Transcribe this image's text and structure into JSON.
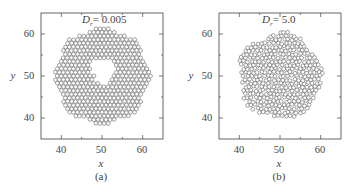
{
  "chart_data": [
    {
      "type": "scatter",
      "panel_label": "(a)",
      "annotation": {
        "symbol": "D",
        "subscript": "r",
        "value": "= 0.005"
      },
      "xlabel": "x",
      "ylabel": "y",
      "xlim": [
        35,
        65
      ],
      "ylim": [
        35,
        65
      ],
      "xticks": [
        40,
        50,
        60
      ],
      "yticks": [
        40,
        50,
        60
      ],
      "minor_xticks": [
        45,
        55
      ],
      "minor_yticks": [
        45,
        55
      ],
      "grid": false,
      "marker": "open circle",
      "description": "Ring-shaped cluster of ~400 close-packed disks centred near (50,50), outer radius ~11.5, with an empty central cavity of radius ~3 at about (50,51)",
      "cluster": {
        "center": [
          50,
          50
        ],
        "outer_radius": 11.5,
        "cavity_center": [
          50.3,
          51.2
        ],
        "cavity_radius": 3.0,
        "particle_diameter": 1.0
      }
    },
    {
      "type": "scatter",
      "panel_label": "(b)",
      "annotation": {
        "symbol": "D",
        "subscript": "r",
        "value": "= 5.0"
      },
      "xlabel": "x",
      "ylabel": "y",
      "xlim": [
        35,
        65
      ],
      "ylim": [
        35,
        65
      ],
      "xticks": [
        40,
        50,
        60
      ],
      "yticks": [
        40,
        50,
        60
      ],
      "minor_xticks": [
        45,
        55
      ],
      "minor_yticks": [
        45,
        55
      ],
      "grid": false,
      "marker": "open circle",
      "description": "Compact disordered filled cluster of close-packed disks centred near (50,50), radius ~10, no cavity",
      "cluster": {
        "center": [
          50,
          50
        ],
        "outer_radius": 10.2,
        "cavity_center": null,
        "cavity_radius": 0,
        "particle_diameter": 1.0
      }
    }
  ],
  "panels": [
    {
      "label": "(a)",
      "xlabel": "x",
      "ylabel": "y",
      "ann_symbol": "D",
      "ann_sub": "r",
      "ann_value": "= 0.005",
      "xtick_labels": [
        "40",
        "50",
        "60"
      ],
      "ytick_labels": [
        "60",
        "50",
        "40"
      ]
    },
    {
      "label": "(b)",
      "xlabel": "x",
      "ylabel": "y",
      "ann_symbol": "D",
      "ann_sub": "r",
      "ann_value": "= 5.0",
      "xtick_labels": [
        "40",
        "50",
        "60"
      ],
      "ytick_labels": [
        "60",
        "50",
        "40"
      ]
    }
  ],
  "colors": {
    "axis": "#555555",
    "marker_edge": "#555555",
    "marker_fill": "#ffffff",
    "text": "#444444"
  }
}
